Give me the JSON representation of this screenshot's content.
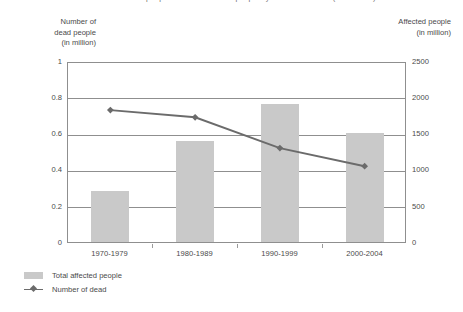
{
  "title": "Number of dead people and total affected people by natural disasters (1970-2004)",
  "axes": {
    "left_title_lines": [
      "Number of",
      "dead people",
      "(in million)"
    ],
    "right_title_lines": [
      "Affected people",
      "(in million)"
    ],
    "left_ticks": [
      "1",
      "0.8",
      "0.6",
      "0.4",
      "0.2",
      "0"
    ],
    "right_ticks": [
      "2500",
      "2000",
      "1500",
      "1000",
      "500",
      "0"
    ]
  },
  "legend": {
    "items": [
      {
        "label": "Total affected people",
        "marker": "bar-swatch",
        "color": "#c9c9c9"
      },
      {
        "label": "Number of dead",
        "marker": "line-marker",
        "color": "#6b6b6b"
      }
    ]
  },
  "chart_data": {
    "type": "bar",
    "title": "Number of dead people and total affected people by natural disasters (1970-2004)",
    "xlabel": "",
    "ylabel": "Number of dead people (in million)",
    "y2label": "Affected people (in million)",
    "categories": [
      "1970-1979",
      "1980-1989",
      "1990-1999",
      "2000-2004"
    ],
    "ylim": [
      0,
      1
    ],
    "y2lim": [
      0,
      2500
    ],
    "grid": true,
    "legend_position": "bottom-left",
    "series": [
      {
        "name": "Total affected people",
        "type": "bar",
        "axis": "right",
        "color": "#c9c9c9",
        "values": [
          700,
          1400,
          1900,
          1500
        ]
      },
      {
        "name": "Number of dead",
        "type": "line",
        "axis": "left",
        "color": "#6b6b6b",
        "values": [
          0.74,
          0.7,
          0.53,
          0.43
        ]
      }
    ]
  }
}
